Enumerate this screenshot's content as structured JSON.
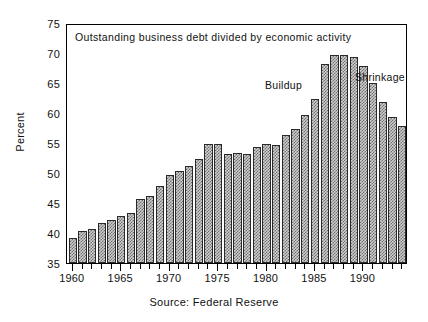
{
  "chart_data": {
    "type": "bar",
    "title": "Outstanding business debt divided by economic activity",
    "xlabel": "",
    "ylabel": "Percent",
    "source": "Source: Federal Reserve",
    "ylim": [
      35,
      75
    ],
    "yticks": [
      35,
      40,
      45,
      50,
      55,
      60,
      65,
      70,
      75
    ],
    "xticks_major": [
      1960,
      1965,
      1970,
      1975,
      1980,
      1985,
      1990
    ],
    "xtick_labels": [
      "1960",
      "1965",
      "1970",
      "1975",
      "1980",
      "1985",
      "1990"
    ],
    "xlim": [
      1959.4,
      1994.6
    ],
    "grid": false,
    "legend": "none",
    "bar_color": "#cfcfcf",
    "bar_edge_color": "#2a2a2a",
    "categories": [
      "1960",
      "1961",
      "1962",
      "1963",
      "1964",
      "1965",
      "1966",
      "1967",
      "1968",
      "1969",
      "1970",
      "1971",
      "1972",
      "1973",
      "1974",
      "1975",
      "1976",
      "1977",
      "1978",
      "1979",
      "1980",
      "1981",
      "1982",
      "1983",
      "1984",
      "1985",
      "1986",
      "1987",
      "1988",
      "1989",
      "1990",
      "1991",
      "1992",
      "1993",
      "1994"
    ],
    "values": [
      39.2,
      40.4,
      40.7,
      41.7,
      42.1,
      42.9,
      43.4,
      45.6,
      46.1,
      47.8,
      49.6,
      50.3,
      51.1,
      52.3,
      54.8,
      54.9,
      53.2,
      53.4,
      53.2,
      54.3,
      54.9,
      54.6,
      56.4,
      57.3,
      59.7,
      62.3,
      68.1,
      69.7,
      69.7,
      69.4,
      67.8,
      65.0,
      61.8,
      59.3,
      57.8
    ],
    "annotations": [
      {
        "text": "Buildup",
        "x": 1986,
        "y": 66.5
      },
      {
        "text": "Shrinkage",
        "x": 1991,
        "y": 67.5
      }
    ]
  }
}
